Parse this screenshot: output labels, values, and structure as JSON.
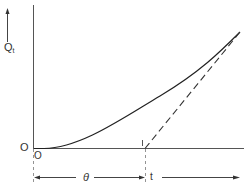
{
  "diagram": {
    "y_axis_label": "Q",
    "y_axis_label_sub": "t",
    "origin_label_left": "O",
    "origin_label_below": "O",
    "lag_label": "θ",
    "time_label": "t",
    "lag_tick_label": "I",
    "elements": {
      "curve": "solid curve rising from origin, asymptotic to dashed line",
      "asymptote": "dashed straight line starting at t = θ on time axis",
      "lag_interval": "dimension arrow from 0 to θ",
      "time_arrow": "arrow pointing right labeled t"
    }
  }
}
